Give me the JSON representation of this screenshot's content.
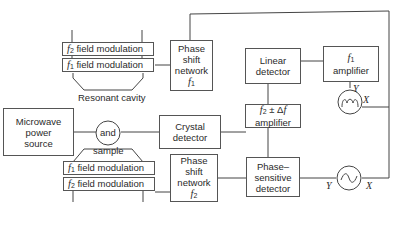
{
  "diagram": {
    "type": "block-diagram"
  },
  "modulation": {
    "top_f2": {
      "sym": "f",
      "sub": "2",
      "text": " field modulation"
    },
    "top_f1": {
      "sym": "f",
      "sub": "1",
      "text": " field modulation"
    },
    "bot_f1": {
      "sym": "f",
      "sub": "1",
      "text": " field modulation"
    },
    "bot_f2": {
      "sym": "f",
      "sub": "2",
      "text": " field modulation"
    }
  },
  "blocks": {
    "microwave": [
      "Microwave",
      "power",
      "source"
    ],
    "cavity": {
      "top": "Resonant cavity",
      "center": "and",
      "bottom": "sample"
    },
    "crystal": [
      "Crystal",
      "detector"
    ],
    "phase1": [
      "Phase",
      "shift",
      "network"
    ],
    "phase1_sym": {
      "sym": "f",
      "sub": "1"
    },
    "phase2": [
      "Phase",
      "shift",
      "network"
    ],
    "phase2_sym": {
      "sym": "f",
      "sub": "2"
    },
    "linear": [
      "Linear",
      "detector"
    ],
    "f1amp": {
      "sym": "f",
      "sub": "1",
      "text": "amplifier"
    },
    "f2amp": {
      "sym": "f",
      "sub": "2",
      "op": " ± Δ",
      "sym2": "f",
      "text": "amplifier"
    },
    "psd": [
      "Phase–",
      "sensitive",
      "detector"
    ]
  },
  "scopes": {
    "top": {
      "y_label": "Y",
      "x_label": "X",
      "trace": "absorption-derivative"
    },
    "bottom": {
      "y_label": "Y",
      "x_label": "X",
      "trace": "sine"
    }
  }
}
